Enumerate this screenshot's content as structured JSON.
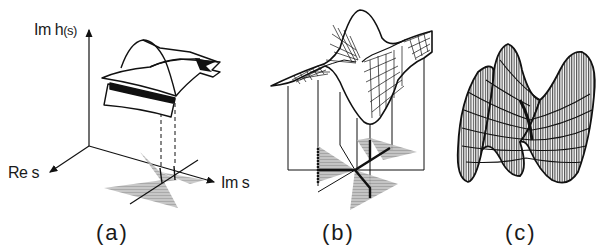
{
  "figure": {
    "panels": [
      {
        "id": "a",
        "label": "(a)",
        "axes": {
          "vertical": "Im h(s)",
          "vertical_main": "Im h",
          "vertical_arg": "(s)",
          "left": "Re s",
          "right": "Im s"
        },
        "description": "multi-sheeted surface above complex plane with dashed projections to branch cut region"
      },
      {
        "id": "b",
        "label": "(b)",
        "description": "saddle-like wireframe surface with peak and trough, vertical projection lines down to shaded sector plane"
      },
      {
        "id": "c",
        "label": "(c)",
        "description": "dense wireframe monkey-saddle surface with three lobes"
      }
    ],
    "colors": {
      "ink": "#111111",
      "shade": "#9a9a9a",
      "background": "#ffffff"
    }
  }
}
